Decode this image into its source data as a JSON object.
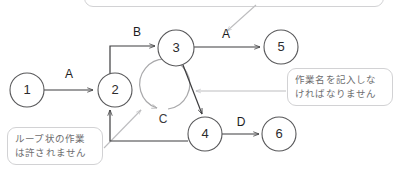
{
  "diagram": {
    "type": "arrow-diagram",
    "nodes": [
      {
        "id": "1",
        "label": "1",
        "cx": 27,
        "cy": 90,
        "r": 17
      },
      {
        "id": "2",
        "label": "2",
        "cx": 115,
        "cy": 90,
        "r": 17
      },
      {
        "id": "3",
        "label": "3",
        "cx": 176,
        "cy": 48,
        "r": 18
      },
      {
        "id": "4",
        "label": "4",
        "cx": 205,
        "cy": 134,
        "r": 17
      },
      {
        "id": "5",
        "label": "5",
        "cx": 281,
        "cy": 47,
        "r": 17
      },
      {
        "id": "6",
        "label": "6",
        "cx": 279,
        "cy": 134,
        "r": 17
      }
    ],
    "edges": [
      {
        "id": "e1",
        "from": "1",
        "to": "2",
        "label": "A",
        "label_x": 69,
        "label_y": 75
      },
      {
        "id": "e2",
        "from": "2",
        "to": "3",
        "label": "B",
        "label_x": 137,
        "label_y": 33
      },
      {
        "id": "e3",
        "from": "3",
        "to": "5",
        "label": "A",
        "label_x": 226,
        "label_y": 35
      },
      {
        "id": "e4",
        "from": "3",
        "to": "4",
        "label": "",
        "label_x": 0,
        "label_y": 0
      },
      {
        "id": "e5",
        "from": "4",
        "to": "6",
        "label": "D",
        "label_x": 241,
        "label_y": 123
      },
      {
        "id": "e6",
        "from": "4",
        "to": "2",
        "label": "",
        "label_x": 0,
        "label_y": 0
      }
    ],
    "loop": {
      "id": "loop-c",
      "label": "C",
      "label_x": 163,
      "label_y": 120
    }
  },
  "callouts": [
    {
      "id": "callout-loop",
      "text": "ループ状の作業\nは許されません",
      "target": "loop-c"
    },
    {
      "id": "callout-name",
      "text": "作業名を記入しな\nければなりません",
      "target": "e4"
    },
    {
      "id": "callout-top",
      "text": "",
      "target": "e3"
    }
  ],
  "colors": {
    "node_stroke": "#58585a",
    "edge_stroke": "#3c3c3e",
    "loop_stroke": "#a9a9ab",
    "pointer_stroke": "#bdbdbf",
    "callout_border": "#d2d2d4",
    "callout_text": "#6e6e70",
    "background": "#ffffff"
  }
}
